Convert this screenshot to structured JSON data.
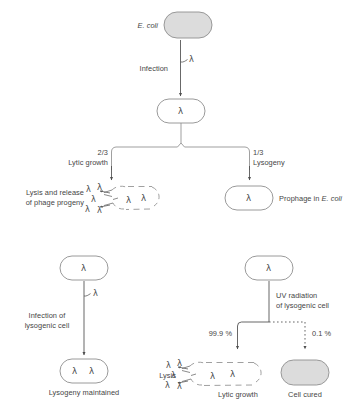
{
  "figure": {
    "title_visible": false,
    "symbols": {
      "lambda": "λ"
    },
    "colors": {
      "cell_fill_grey": "#dcdcdc",
      "cell_fill_white": "#ffffff",
      "stroke": "#8c8c8c",
      "arrow": "#4d4d4d",
      "text": "#454545"
    }
  },
  "top_panel": {
    "host_label": "E. coli",
    "host_label_italic": true,
    "infection_label": "Infection",
    "infection_phage": "λ",
    "infected_cell_phage": "λ",
    "branches": [
      {
        "fraction": "2/3",
        "name": "Lytic growth",
        "outcome_label_line1": "Lysis and release",
        "outcome_label_line2": "of phage progeny",
        "burst_cell_phages": [
          "λ",
          "λ"
        ],
        "released_phages": [
          "λ",
          "λ",
          "λ",
          "λ",
          "λ"
        ]
      },
      {
        "fraction": "1/3",
        "name": "Lysogeny",
        "cell_phage": "λ",
        "outcome_label": "Prophage in ",
        "outcome_label_italic": "E. coli"
      }
    ]
  },
  "bottom_left_panel": {
    "source_cell_phage": "λ",
    "arrow_phage": "λ",
    "process_line1": "Infection of",
    "process_line2": "lysogenic cell",
    "result_cell_phages": [
      "λ",
      "λ"
    ],
    "result_label": "Lysogeny maintained"
  },
  "bottom_right_panel": {
    "source_cell_phage": "λ",
    "process_line1": "UV radiation",
    "process_line2": "of lysogenic cell",
    "branches": [
      {
        "percent": "99.9 %",
        "style": "solid",
        "side_label": "Lysis",
        "result_label": "Lytic growth",
        "burst_cell_phages": [
          "λ",
          "λ"
        ],
        "released_phages": [
          "λ",
          "λ",
          "λ",
          "λ",
          "λ"
        ]
      },
      {
        "percent": "0.1 %",
        "style": "dotted",
        "result_label": "Cell cured"
      }
    ]
  }
}
